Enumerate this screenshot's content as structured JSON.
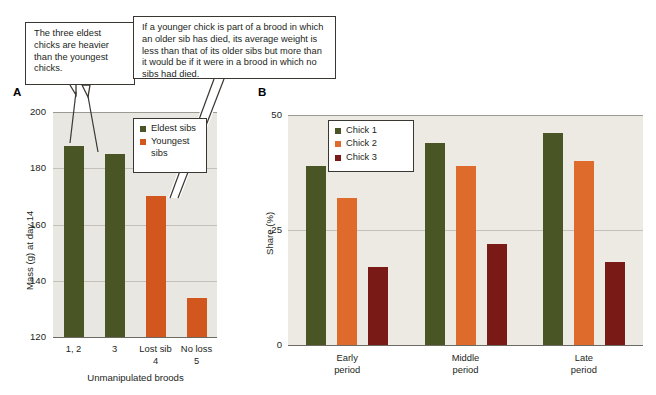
{
  "callouts": [
    {
      "id": "callout-1",
      "text": "The three eldest chicks are heavier than the youngest chicks."
    },
    {
      "id": "callout-2",
      "text": "If a younger chick is part of a brood in which an older sib has died, its average weight is less than that of its older sibs but more than it would be if it were in a brood in which no sibs had died."
    }
  ],
  "panels": {
    "a": {
      "letter": "A",
      "legend": [
        {
          "label": "Eldest sibs",
          "color": "#4a5526"
        },
        {
          "label": "Youngest sibs",
          "color": "#d2571f"
        }
      ]
    },
    "b": {
      "letter": "B",
      "legend": [
        {
          "label": "Chick 1",
          "color": "#4a5526"
        },
        {
          "label": "Chick 2",
          "color": "#de6a2c"
        },
        {
          "label": "Chick 3",
          "color": "#7a1a16"
        }
      ]
    }
  },
  "chart_data": [
    {
      "type": "bar",
      "panel": "A",
      "title": "",
      "xlabel": "Unmanipulated broods",
      "ylabel": "Mass (g) at day 14",
      "ylim": [
        120,
        200
      ],
      "yticks": [
        120,
        140,
        160,
        180,
        200
      ],
      "grid": true,
      "legend_position": "inside-top-right",
      "categories": [
        "1, 2",
        "3",
        "Lost sib\n4",
        "No loss\n5"
      ],
      "category_lines": [
        [
          "1, 2"
        ],
        [
          "3"
        ],
        [
          "Lost sib",
          "4"
        ],
        [
          "No loss",
          "5"
        ]
      ],
      "values": [
        188,
        185,
        170,
        134
      ],
      "bar_colors": [
        "#4a5526",
        "#4a5526",
        "#d2571f",
        "#d2571f"
      ],
      "series": [
        {
          "name": "Eldest sibs",
          "color": "#4a5526",
          "values": [
            188,
            185,
            null,
            null
          ]
        },
        {
          "name": "Youngest sibs",
          "color": "#d2571f",
          "values": [
            null,
            null,
            170,
            134
          ]
        }
      ]
    },
    {
      "type": "bar",
      "panel": "B",
      "title": "",
      "xlabel": "",
      "ylabel": "Share (%)",
      "ylim": [
        0,
        50
      ],
      "yticks": [
        0,
        25,
        50
      ],
      "grid": true,
      "legend_position": "inside-top-left",
      "categories": [
        "Early period",
        "Middle period",
        "Late period"
      ],
      "category_lines": [
        [
          "Early",
          "period"
        ],
        [
          "Middle",
          "period"
        ],
        [
          "Late",
          "period"
        ]
      ],
      "series": [
        {
          "name": "Chick 1",
          "color": "#4a5526",
          "values": [
            39,
            44,
            46
          ]
        },
        {
          "name": "Chick 2",
          "color": "#de6a2c",
          "values": [
            32,
            39,
            40
          ]
        },
        {
          "name": "Chick 3",
          "color": "#7a1a16",
          "values": [
            17,
            22,
            18
          ]
        }
      ]
    }
  ]
}
